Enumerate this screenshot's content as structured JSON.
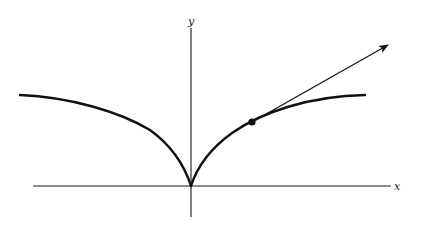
{
  "figure": {
    "axes": {
      "x_label": "x",
      "y_label": "y"
    },
    "curve": {
      "shape": "cusp at origin, two branches rising and flattening outward",
      "left_branch_end": "upper-left",
      "right_branch_end": "upper-right"
    },
    "marked_point": {
      "branch": "right",
      "style": "filled dot"
    },
    "tangent_vector": {
      "from": "marked point",
      "direction": "up and to the right",
      "arrowhead": true
    },
    "colors": {
      "ink": "#111111",
      "background": "#ffffff"
    }
  }
}
